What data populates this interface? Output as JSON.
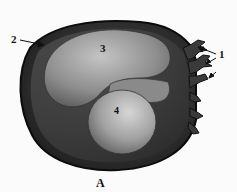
{
  "figure": {
    "caption": "A",
    "labels": [
      {
        "id": "1",
        "text": "1"
      },
      {
        "id": "2",
        "text": "2"
      },
      {
        "id": "3",
        "text": "3"
      },
      {
        "id": "4",
        "text": "4"
      }
    ]
  }
}
